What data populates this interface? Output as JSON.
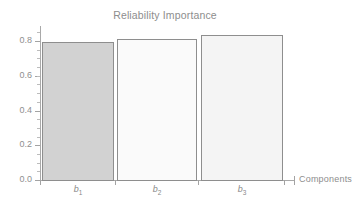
{
  "chart_data": {
    "type": "bar",
    "title": "Reliability Importance",
    "xlabel": "Components",
    "ylabel": "",
    "categories": [
      "b1",
      "b2",
      "b3"
    ],
    "category_labels_html": [
      "b<sub>1</sub>",
      "b<sub>2</sub>",
      "b<sub>3</sub>"
    ],
    "values": [
      0.8,
      0.82,
      0.84
    ],
    "ylim": [
      0.0,
      0.9
    ],
    "ytick_labels": [
      "0.0",
      "0.2",
      "0.4",
      "0.6",
      "0.8"
    ],
    "ytick_values": [
      0.0,
      0.2,
      0.4,
      0.6,
      0.8
    ],
    "yminor_step": 0.05,
    "grid": false,
    "legend": "none",
    "bar_fills": [
      "#d2d2d2",
      "#fafafa",
      "#f4f4f4"
    ],
    "bar_edge_color": "#8e8e8e",
    "axis_color": "#a9a9a9",
    "text_color": "#8d8d8d",
    "background": "#ffffff"
  },
  "chart": {
    "title": "Reliability Importance",
    "x_axis_title": "Components",
    "y_ticks": [
      {
        "label": "0.0",
        "value": 0.0
      },
      {
        "label": "0.2",
        "value": 0.2
      },
      {
        "label": "0.4",
        "value": 0.4
      },
      {
        "label": "0.6",
        "value": 0.6
      },
      {
        "label": "0.8",
        "value": 0.8
      }
    ],
    "bars": [
      {
        "label_main": "b",
        "label_sub": "1",
        "value": 0.8,
        "fill": "#d2d2d2"
      },
      {
        "label_main": "b",
        "label_sub": "2",
        "value": 0.82,
        "fill": "#fafafa"
      },
      {
        "label_main": "b",
        "label_sub": "3",
        "value": 0.84,
        "fill": "#f4f4f4"
      }
    ]
  }
}
